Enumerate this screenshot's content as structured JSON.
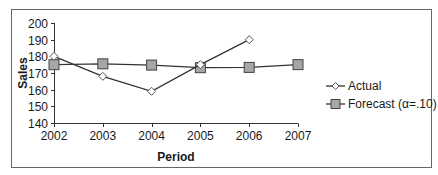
{
  "chart_data": {
    "type": "line",
    "title": "",
    "xlabel": "Period",
    "ylabel": "Sales",
    "x": [
      "2002",
      "2003",
      "2004",
      "2005",
      "2006",
      "2007"
    ],
    "ylim": [
      140,
      200
    ],
    "yticks": [
      140,
      150,
      160,
      170,
      180,
      190,
      200
    ],
    "grid": false,
    "legend_position": "right",
    "series": [
      {
        "name": "Actual",
        "marker": "diamond",
        "marker_fill": "#ffffff",
        "marker_stroke": "#555555",
        "line_color": "#333333",
        "values": [
          180,
          168,
          159,
          175,
          190,
          null
        ]
      },
      {
        "name": "Forecast (α=.10)",
        "marker": "square",
        "marker_fill": "#a6a6a6",
        "marker_stroke": "#444444",
        "line_color": "#333333",
        "values": [
          175,
          175.5,
          174.75,
          173.18,
          173.36,
          175.02
        ]
      }
    ]
  },
  "colors": {
    "frame": "#666666",
    "axis": "#333333",
    "line": "#333333"
  }
}
